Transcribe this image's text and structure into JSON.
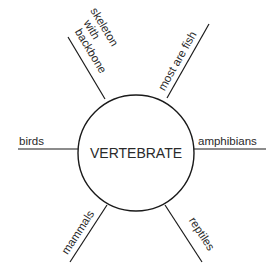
{
  "diagram": {
    "type": "concept-map",
    "center": {
      "label": "VERTEBRATE"
    },
    "branches": [
      {
        "id": "skeleton",
        "lines": [
          "skeleton",
          "with",
          "backbone"
        ]
      },
      {
        "id": "fish",
        "label": "most are fish"
      },
      {
        "id": "birds",
        "label": "birds"
      },
      {
        "id": "amphibians",
        "label": "amphibians"
      },
      {
        "id": "mammals",
        "label": "mammals"
      },
      {
        "id": "reptiles",
        "label": "reptiles"
      }
    ],
    "colors": {
      "stroke": "#1a1a1a",
      "text": "#2a2a2a",
      "background": "#ffffff"
    }
  }
}
